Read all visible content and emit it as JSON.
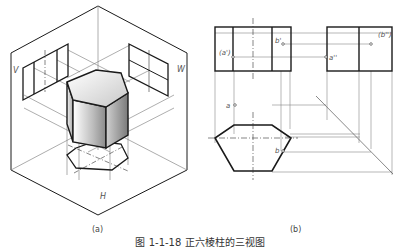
{
  "figure": {
    "caption": "图 1-1-18  正六棱柱的三视图",
    "subfigures": [
      {
        "id": "a",
        "label": "(a)",
        "description": "Isometric projection of a regular hexagonal prism in the three-plane projection system",
        "plane_labels": {
          "vertical": "V",
          "side": "W",
          "horizontal": "H"
        }
      },
      {
        "id": "b",
        "label": "(b)",
        "description": "Three orthographic views of the hexagonal prism with point projections",
        "point_labels": {
          "a_front": "(a')",
          "b_front": "b'",
          "a_side": "a''",
          "b_side": "(b'')",
          "a_top": "a",
          "b_top": "b"
        }
      }
    ]
  },
  "colors": {
    "line": "#1a1a1a",
    "thin_line": "#888888",
    "label": "#555555",
    "background": "#ffffff"
  }
}
